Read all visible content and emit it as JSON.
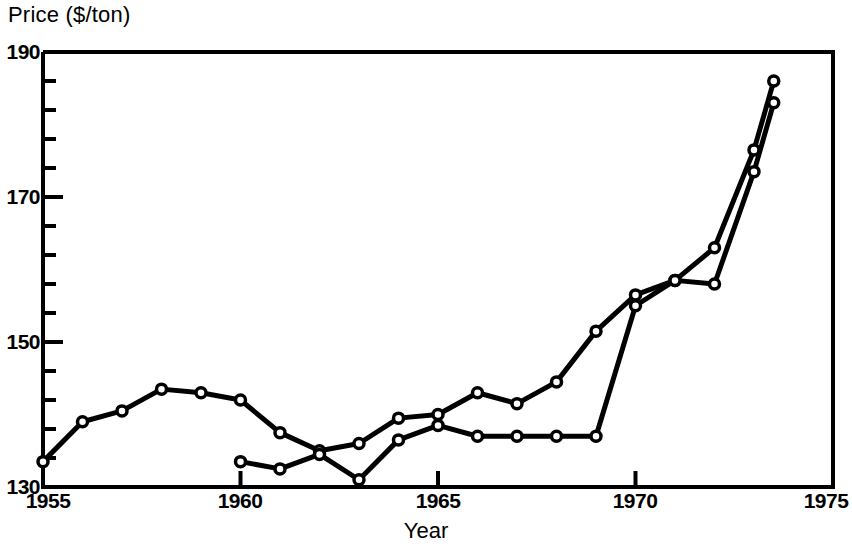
{
  "chart_data": {
    "type": "line",
    "title": "",
    "xlabel": "Year",
    "ylabel": "Price ($/ton)",
    "xlim": [
      1955,
      1975
    ],
    "ylim": [
      130,
      190
    ],
    "x_major_ticks": [
      1955,
      1960,
      1965,
      1970,
      1975
    ],
    "x_tick_labels": [
      "1955",
      "1960",
      "1965",
      "1970",
      "1975"
    ],
    "y_major_ticks": [
      130,
      150,
      170,
      190
    ],
    "y_tick_labels": [
      "130",
      "150",
      "170",
      "190"
    ],
    "y_minor_tick_step": 4,
    "grid": false,
    "legend": "none",
    "marker": "open-circle",
    "line_color": "#000000",
    "series": [
      {
        "name": "series-1",
        "x": [
          1955,
          1956,
          1957,
          1958,
          1959,
          1960,
          1961,
          1962,
          1963,
          1964,
          1965,
          1966,
          1967,
          1968,
          1969,
          1970,
          1971,
          1972,
          1973,
          1973.5
        ],
        "values": [
          133.5,
          139.0,
          140.5,
          143.5,
          143.0,
          142.0,
          137.5,
          135.0,
          136.0,
          139.5,
          140.0,
          143.0,
          141.5,
          144.5,
          151.5,
          156.5,
          158.5,
          163.0,
          176.5,
          186.0
        ]
      },
      {
        "name": "series-2",
        "x": [
          1960,
          1961,
          1962,
          1963,
          1964,
          1965,
          1966,
          1967,
          1968,
          1969,
          1970,
          1971,
          1972,
          1973,
          1973.5
        ],
        "values": [
          133.5,
          132.5,
          134.5,
          131.0,
          136.5,
          138.5,
          137.0,
          137.0,
          137.0,
          137.0,
          155.0,
          158.5,
          158.0,
          173.5,
          183.0
        ]
      }
    ]
  }
}
